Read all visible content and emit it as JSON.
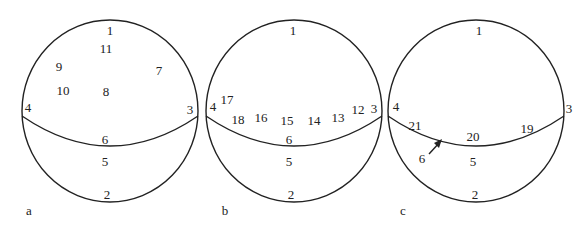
{
  "panels": [
    {
      "id": "a",
      "caption": "a",
      "cx": 110,
      "labels": [
        {
          "t": "1",
          "x": 110,
          "y": 30
        },
        {
          "t": "11",
          "x": 106,
          "y": 48
        },
        {
          "t": "9",
          "x": 59,
          "y": 66
        },
        {
          "t": "7",
          "x": 159,
          "y": 70
        },
        {
          "t": "10",
          "x": 63,
          "y": 90
        },
        {
          "t": "8",
          "x": 106,
          "y": 91
        },
        {
          "t": "4",
          "x": 28,
          "y": 107
        },
        {
          "t": "3",
          "x": 190,
          "y": 109
        },
        {
          "t": "6",
          "x": 105,
          "y": 139
        },
        {
          "t": "5",
          "x": 105,
          "y": 161
        },
        {
          "t": "2",
          "x": 107,
          "y": 194
        }
      ],
      "caption_pos": {
        "x": 29,
        "y": 210
      }
    },
    {
      "id": "b",
      "caption": "b",
      "cx": 292,
      "labels": [
        {
          "t": "1",
          "x": 293,
          "y": 30
        },
        {
          "t": "17",
          "x": 227,
          "y": 99
        },
        {
          "t": "4",
          "x": 213,
          "y": 106
        },
        {
          "t": "18",
          "x": 238,
          "y": 119
        },
        {
          "t": "16",
          "x": 261,
          "y": 117
        },
        {
          "t": "15",
          "x": 287,
          "y": 120
        },
        {
          "t": "14",
          "x": 314,
          "y": 120
        },
        {
          "t": "13",
          "x": 338,
          "y": 117
        },
        {
          "t": "12",
          "x": 358,
          "y": 109
        },
        {
          "t": "3",
          "x": 374,
          "y": 108
        },
        {
          "t": "6",
          "x": 289,
          "y": 139
        },
        {
          "t": "5",
          "x": 289,
          "y": 161
        },
        {
          "t": "2",
          "x": 291,
          "y": 194
        }
      ],
      "caption_pos": {
        "x": 225,
        "y": 210
      }
    },
    {
      "id": "c",
      "caption": "c",
      "cx": 478,
      "labels": [
        {
          "t": "1",
          "x": 479,
          "y": 30
        },
        {
          "t": "4",
          "x": 396,
          "y": 106
        },
        {
          "t": "3",
          "x": 569,
          "y": 108
        },
        {
          "t": "21",
          "x": 415,
          "y": 125
        },
        {
          "t": "19",
          "x": 527,
          "y": 128
        },
        {
          "t": "20",
          "x": 473,
          "y": 136
        },
        {
          "t": "6",
          "x": 422,
          "y": 158
        },
        {
          "t": "5",
          "x": 473,
          "y": 161
        },
        {
          "t": "2",
          "x": 475,
          "y": 194
        }
      ],
      "caption_pos": {
        "x": 403,
        "y": 210
      }
    }
  ]
}
